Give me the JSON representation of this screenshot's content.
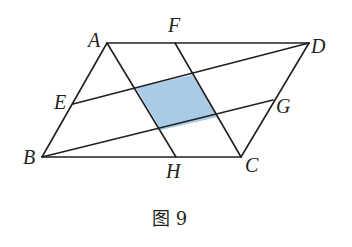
{
  "figure": {
    "caption": "图 9",
    "shape": "parallelogram ABCD with segments AH, CF, DE, BG forming a shaded inner quadrilateral",
    "shade_color": "#a8cbe8",
    "line_color": "#231f20",
    "points": {
      "A": {
        "label": "A",
        "x": 107,
        "y": 43
      },
      "F": {
        "label": "F",
        "x": 175,
        "y": 43
      },
      "D": {
        "label": "D",
        "x": 309,
        "y": 43
      },
      "E": {
        "label": "E",
        "x": 73,
        "y": 104
      },
      "G": {
        "label": "G",
        "x": 273,
        "y": 100
      },
      "B": {
        "label": "B",
        "x": 42,
        "y": 157
      },
      "H": {
        "label": "H",
        "x": 176,
        "y": 157
      },
      "C": {
        "label": "C",
        "x": 241,
        "y": 157
      }
    },
    "segments": [
      "AD",
      "BC",
      "AB",
      "CD",
      "AH",
      "FC",
      "ED",
      "BG"
    ],
    "shaded_region": "intersection quadrilateral of AH, FC, ED, BG"
  }
}
